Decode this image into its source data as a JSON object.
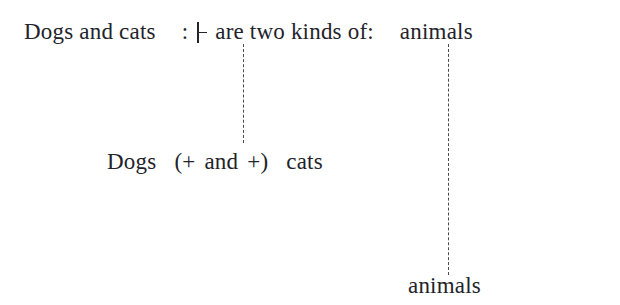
{
  "figure": {
    "background_color": "#ffffff",
    "text_color": "#23232a",
    "line_color": "#4a4a52",
    "top_line": {
      "subject": "Dogs and cats",
      "colon_1": ":",
      "turnstile_symbol": "⊦",
      "predicate": "are two kinds of:",
      "object": "animals"
    },
    "middle_line": {
      "word_1": "Dogs",
      "open_paren": "(+",
      "connector_word": "and",
      "close_paren": "+)",
      "word_2": "cats"
    },
    "bottom_line": {
      "word": "animals"
    },
    "connectors": [
      {
        "name": "left-connector",
        "from": "turnstile",
        "to": "and",
        "style": "dashed"
      },
      {
        "name": "right-connector",
        "from": "are two kinds of:",
        "to": "animals",
        "style": "dashed"
      }
    ]
  }
}
